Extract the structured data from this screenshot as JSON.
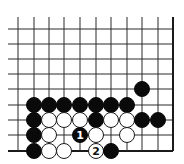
{
  "diagram": {
    "type": "go-board-fragment",
    "grid": {
      "columns_x": [
        18,
        34,
        49,
        64,
        80,
        96,
        111,
        127,
        142,
        158,
        173
      ],
      "rows_y": [
        29,
        44,
        59,
        74,
        89,
        105,
        120,
        135,
        151
      ],
      "line_start_x": 8,
      "line_start_y": 17,
      "right_edge": true,
      "bottom_edge": true,
      "stone_radius": 7.5
    },
    "stones": [
      {
        "color": "black",
        "col": 8,
        "row": 4
      },
      {
        "color": "black",
        "col": 1,
        "row": 5
      },
      {
        "color": "black",
        "col": 2,
        "row": 5
      },
      {
        "color": "black",
        "col": 3,
        "row": 5
      },
      {
        "color": "black",
        "col": 4,
        "row": 5
      },
      {
        "color": "black",
        "col": 5,
        "row": 5
      },
      {
        "color": "black",
        "col": 6,
        "row": 5
      },
      {
        "color": "black",
        "col": 7,
        "row": 5
      },
      {
        "color": "black",
        "col": 1,
        "row": 6
      },
      {
        "color": "white",
        "col": 2,
        "row": 6
      },
      {
        "color": "white",
        "col": 3,
        "row": 6
      },
      {
        "color": "white",
        "col": 4,
        "row": 6
      },
      {
        "color": "black",
        "col": 5,
        "row": 6
      },
      {
        "color": "white",
        "col": 6,
        "row": 6
      },
      {
        "color": "white",
        "col": 7,
        "row": 6
      },
      {
        "color": "black",
        "col": 8,
        "row": 6
      },
      {
        "color": "black",
        "col": 9,
        "row": 6
      },
      {
        "color": "black",
        "col": 1,
        "row": 7
      },
      {
        "color": "white",
        "col": 2,
        "row": 7
      },
      {
        "color": "black",
        "col": 4,
        "row": 7,
        "label": "1"
      },
      {
        "color": "white",
        "col": 5,
        "row": 7
      },
      {
        "color": "white",
        "col": 7,
        "row": 7
      },
      {
        "color": "black",
        "col": 1,
        "row": 8
      },
      {
        "color": "white",
        "col": 2,
        "row": 8
      },
      {
        "color": "white",
        "col": 3,
        "row": 8
      },
      {
        "color": "white",
        "col": 5,
        "row": 8,
        "label": "2"
      },
      {
        "color": "black",
        "col": 6,
        "row": 8
      }
    ],
    "move_labels": [
      "1",
      "2"
    ]
  }
}
